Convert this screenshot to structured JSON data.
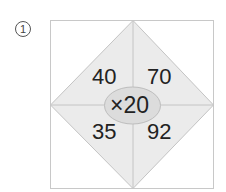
{
  "problem": {
    "marker": "1",
    "center": "×20",
    "cells": {
      "top_left": "40",
      "top_right": "70",
      "bottom_left": "35",
      "bottom_right": "92"
    }
  },
  "colors": {
    "diamond_fill": "#ebebeb",
    "ellipse_fill": "#dcdcdc",
    "lines": "#bdbdbd"
  }
}
